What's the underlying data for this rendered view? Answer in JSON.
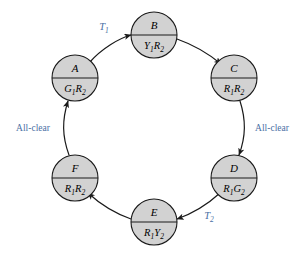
{
  "diagram": {
    "colors": {
      "node_fill": "#d2d2d2",
      "node_stroke": "#1a1a1a",
      "edge_stroke": "#1a1a1a",
      "label_blue": "#4a6fa5",
      "background": "#ffffff"
    },
    "nodes": [
      {
        "id": "A",
        "name": "A",
        "state_top": "A",
        "state_main": "G",
        "state_sub1": "1",
        "state_mid": "R",
        "state_sub2": "2",
        "cx": 75,
        "cy": 78
      },
      {
        "id": "B",
        "name": "B",
        "state_top": "B",
        "state_main": "Y",
        "state_sub1": "1",
        "state_mid": "R",
        "state_sub2": "2",
        "cx": 154,
        "cy": 35
      },
      {
        "id": "C",
        "name": "C",
        "state_top": "C",
        "state_main": "R",
        "state_sub1": "1",
        "state_mid": "R",
        "state_sub2": "2",
        "cx": 234,
        "cy": 78
      },
      {
        "id": "D",
        "name": "D",
        "state_top": "D",
        "state_main": "R",
        "state_sub1": "1",
        "state_mid": "G",
        "state_sub2": "2",
        "cx": 234,
        "cy": 178
      },
      {
        "id": "E",
        "name": "E",
        "state_top": "E",
        "state_main": "R",
        "state_sub1": "1",
        "state_mid": "Y",
        "state_sub2": "2",
        "cx": 154,
        "cy": 222
      },
      {
        "id": "F",
        "name": "F",
        "state_top": "F",
        "state_main": "R",
        "state_sub1": "1",
        "state_mid": "R",
        "state_sub2": "2",
        "cx": 75,
        "cy": 178
      }
    ],
    "edges": [
      {
        "id": "A-B",
        "from": "A",
        "to": "B",
        "label": "T",
        "label_sub": "1",
        "label_style": "italic",
        "label_x": 104,
        "label_y": 30
      },
      {
        "id": "B-C",
        "from": "B",
        "to": "C",
        "label": "",
        "label_sub": "",
        "label_style": "none",
        "label_x": 0,
        "label_y": 0
      },
      {
        "id": "C-D",
        "from": "C",
        "to": "D",
        "label": "All-clear",
        "label_sub": "",
        "label_style": "plain",
        "label_x": 272,
        "label_y": 131
      },
      {
        "id": "D-E",
        "from": "D",
        "to": "E",
        "label": "T",
        "label_sub": "2",
        "label_style": "italic",
        "label_x": 209,
        "label_y": 219
      },
      {
        "id": "E-F",
        "from": "E",
        "to": "F",
        "label": "",
        "label_sub": "",
        "label_style": "none",
        "label_x": 0,
        "label_y": 0
      },
      {
        "id": "F-A",
        "from": "F",
        "to": "A",
        "label": "All-clear",
        "label_sub": "",
        "label_style": "plain",
        "label_x": 33,
        "label_y": 131
      }
    ]
  }
}
